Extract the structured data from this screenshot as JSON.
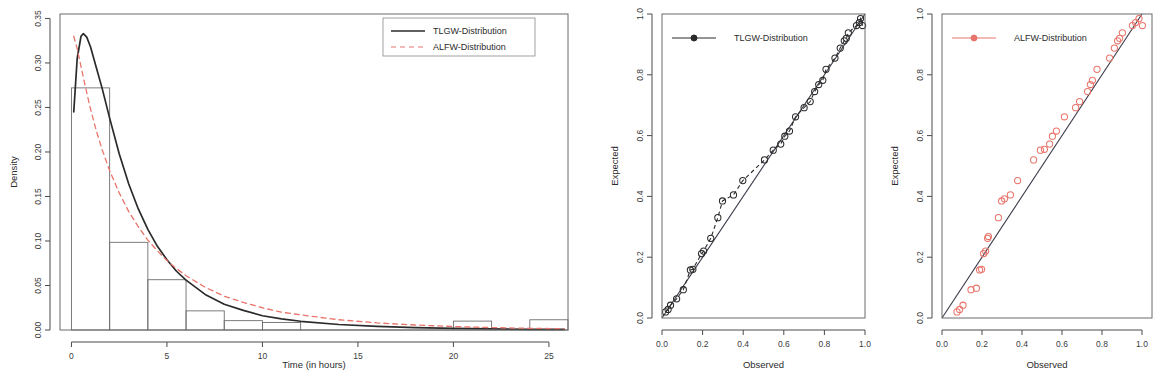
{
  "figure": {
    "panel_count": 3,
    "background": "#ffffff",
    "colors": {
      "tlgw": "#2b2b2b",
      "alfw": "#e8756b",
      "bar_stroke": "#6e6e6e",
      "axis": "#4a4a4a",
      "reference_line": "#3a3a4a"
    }
  },
  "chart_data": [
    {
      "type": "histogram",
      "panel": "left",
      "title": "",
      "xlabel": "Time (in hours)",
      "ylabel": "Density",
      "xlim": [
        -0.6,
        26.0
      ],
      "ylim": [
        0.0,
        0.355
      ],
      "xticks": [
        0,
        5,
        10,
        15,
        20,
        25
      ],
      "xticklabels": [
        "0",
        "5",
        "10",
        "15",
        "20",
        "25"
      ],
      "yticks": [
        0.0,
        0.05,
        0.1,
        0.15,
        0.2,
        0.25,
        0.3,
        0.35
      ],
      "yticklabels": [
        "0.00",
        "0.05",
        "0.10",
        "0.15",
        "0.20",
        "0.25",
        "0.30",
        "0.35"
      ],
      "grid": false,
      "bin_edges": [
        0,
        2,
        4,
        6,
        8,
        10,
        12,
        14,
        16,
        18,
        20,
        22,
        24,
        26
      ],
      "bin_densities": [
        0.272,
        0.0985,
        0.0565,
        0.0215,
        0.0105,
        0.0085,
        0.0,
        0.0,
        0.0,
        0.0,
        0.01,
        0.0,
        0.0115
      ],
      "legend_position": "top-right",
      "series": [
        {
          "name": "TLGW-Distribution",
          "style": "solid",
          "color": "#2b2b2b",
          "x": [
            0.12,
            0.3,
            0.5,
            0.62,
            0.8,
            1.0,
            1.3,
            1.6,
            2.0,
            2.5,
            3.0,
            3.5,
            4.0,
            4.5,
            5.0,
            5.5,
            6.0,
            7.0,
            8.0,
            9.0,
            10.0,
            11.0,
            12.0,
            14.0,
            16.0,
            18.0,
            20.0,
            22.0,
            24.0,
            25.8
          ],
          "values": [
            0.245,
            0.305,
            0.33,
            0.333,
            0.329,
            0.318,
            0.295,
            0.272,
            0.238,
            0.198,
            0.164,
            0.136,
            0.113,
            0.094,
            0.079,
            0.066,
            0.056,
            0.04,
            0.029,
            0.022,
            0.016,
            0.0125,
            0.0098,
            0.0062,
            0.004,
            0.0027,
            0.0018,
            0.0012,
            0.0008,
            0.0006
          ]
        },
        {
          "name": "ALFW-Distribution",
          "style": "dashed",
          "color": "#e8756b",
          "x": [
            0.12,
            0.3,
            0.5,
            0.7,
            1.0,
            1.3,
            1.6,
            2.0,
            2.5,
            3.0,
            3.5,
            4.0,
            4.5,
            5.0,
            5.5,
            6.0,
            7.0,
            8.0,
            9.0,
            10.0,
            11.0,
            12.0,
            14.0,
            16.0,
            18.0,
            20.0,
            22.0,
            24.0,
            25.8
          ],
          "values": [
            0.33,
            0.316,
            0.296,
            0.276,
            0.248,
            0.224,
            0.203,
            0.179,
            0.154,
            0.133,
            0.116,
            0.101,
            0.089,
            0.078,
            0.069,
            0.061,
            0.048,
            0.038,
            0.031,
            0.025,
            0.02,
            0.017,
            0.0115,
            0.008,
            0.0056,
            0.0039,
            0.0027,
            0.0019,
            0.0014
          ]
        }
      ],
      "legend": [
        {
          "label": "TLGW-Distribution",
          "style": "solid",
          "color": "#2b2b2b"
        },
        {
          "label": "ALFW-Distribution",
          "style": "dashed",
          "color": "#e8756b"
        }
      ]
    },
    {
      "type": "scatter",
      "panel": "middle",
      "subtype": "pp-plot",
      "title": "",
      "xlabel": "Observed",
      "ylabel": "Expected",
      "xlim": [
        0.0,
        1.0
      ],
      "ylim": [
        0.0,
        1.0
      ],
      "xticks": [
        0.0,
        0.2,
        0.4,
        0.6,
        0.8,
        1.0
      ],
      "xticklabels": [
        "0.0",
        "0.2",
        "0.4",
        "0.6",
        "0.8",
        "1.0"
      ],
      "yticks": [
        0.0,
        0.2,
        0.4,
        0.6,
        0.8,
        1.0
      ],
      "yticklabels": [
        "0.0",
        "0.2",
        "0.4",
        "0.6",
        "0.8",
        "1.0"
      ],
      "grid": false,
      "legend_position": "top-left",
      "reference_line": {
        "from": [
          0.0,
          0.0
        ],
        "to": [
          1.0,
          1.0
        ],
        "style": "solid",
        "color": "#3a3a4a"
      },
      "marker": "open-circle-dashed",
      "color": "#2b2b2b",
      "legend": [
        {
          "label": "TLGW-Distribution",
          "style": "line-marker",
          "color": "#2b2b2b"
        }
      ],
      "points": [
        [
          0.018,
          0.02
        ],
        [
          0.03,
          0.028
        ],
        [
          0.042,
          0.042
        ],
        [
          0.072,
          0.063
        ],
        [
          0.105,
          0.093
        ],
        [
          0.14,
          0.158
        ],
        [
          0.152,
          0.16
        ],
        [
          0.195,
          0.212
        ],
        [
          0.205,
          0.22
        ],
        [
          0.24,
          0.262
        ],
        [
          0.275,
          0.33
        ],
        [
          0.298,
          0.385
        ],
        [
          0.352,
          0.405
        ],
        [
          0.398,
          0.452
        ],
        [
          0.505,
          0.52
        ],
        [
          0.548,
          0.552
        ],
        [
          0.585,
          0.572
        ],
        [
          0.605,
          0.598
        ],
        [
          0.628,
          0.615
        ],
        [
          0.658,
          0.662
        ],
        [
          0.7,
          0.692
        ],
        [
          0.73,
          0.712
        ],
        [
          0.752,
          0.745
        ],
        [
          0.772,
          0.768
        ],
        [
          0.792,
          0.782
        ],
        [
          0.808,
          0.818
        ],
        [
          0.852,
          0.855
        ],
        [
          0.878,
          0.888
        ],
        [
          0.898,
          0.912
        ],
        [
          0.908,
          0.92
        ],
        [
          0.918,
          0.938
        ],
        [
          0.958,
          0.962
        ],
        [
          0.972,
          0.972
        ],
        [
          0.978,
          0.985
        ],
        [
          0.988,
          0.962
        ]
      ]
    },
    {
      "type": "scatter",
      "panel": "right",
      "subtype": "pp-plot",
      "title": "",
      "xlabel": "Observed",
      "ylabel": "Expected",
      "xlim": [
        0.0,
        1.05
      ],
      "ylim": [
        0.0,
        1.0
      ],
      "xticks": [
        0.0,
        0.2,
        0.4,
        0.6,
        0.8,
        1.0
      ],
      "xticklabels": [
        "0.0",
        "0.2",
        "0.4",
        "0.6",
        "0.8",
        "1.0"
      ],
      "yticks": [
        0.0,
        0.2,
        0.4,
        0.6,
        0.8,
        1.0
      ],
      "yticklabels": [
        "0.0",
        "0.2",
        "0.4",
        "0.6",
        "0.8",
        "1.0"
      ],
      "grid": false,
      "legend_position": "top-left",
      "reference_line": {
        "from": [
          0.0,
          0.0
        ],
        "to": [
          1.0,
          1.0
        ],
        "style": "solid",
        "color": "#3a3a4a"
      },
      "marker": "open-circle",
      "color": "#e8756b",
      "legend": [
        {
          "label": "ALFW-Distribution",
          "style": "line-marker",
          "color": "#e8756b"
        }
      ],
      "points": [
        [
          0.075,
          0.02
        ],
        [
          0.088,
          0.028
        ],
        [
          0.105,
          0.042
        ],
        [
          0.145,
          0.093
        ],
        [
          0.172,
          0.098
        ],
        [
          0.188,
          0.158
        ],
        [
          0.198,
          0.16
        ],
        [
          0.208,
          0.212
        ],
        [
          0.218,
          0.22
        ],
        [
          0.228,
          0.262
        ],
        [
          0.232,
          0.268
        ],
        [
          0.282,
          0.33
        ],
        [
          0.298,
          0.385
        ],
        [
          0.312,
          0.392
        ],
        [
          0.342,
          0.405
        ],
        [
          0.378,
          0.452
        ],
        [
          0.458,
          0.52
        ],
        [
          0.492,
          0.552
        ],
        [
          0.512,
          0.555
        ],
        [
          0.538,
          0.572
        ],
        [
          0.552,
          0.598
        ],
        [
          0.572,
          0.615
        ],
        [
          0.612,
          0.662
        ],
        [
          0.668,
          0.692
        ],
        [
          0.688,
          0.712
        ],
        [
          0.728,
          0.745
        ],
        [
          0.742,
          0.768
        ],
        [
          0.752,
          0.782
        ],
        [
          0.775,
          0.818
        ],
        [
          0.838,
          0.855
        ],
        [
          0.862,
          0.888
        ],
        [
          0.878,
          0.912
        ],
        [
          0.888,
          0.92
        ],
        [
          0.902,
          0.938
        ],
        [
          0.952,
          0.962
        ],
        [
          0.968,
          0.972
        ],
        [
          0.985,
          0.985
        ],
        [
          1.002,
          0.962
        ]
      ]
    }
  ]
}
